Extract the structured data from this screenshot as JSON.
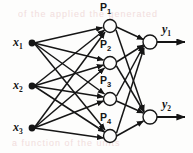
{
  "figure": {
    "background_color": "#fdfdfc",
    "ink_color": "#151515",
    "ghost_text_color": "#f0d8d8",
    "width": 193,
    "height": 153
  },
  "ghost_text": {
    "top": "of the applied the generated",
    "bottom": "a  function  of  the  units"
  },
  "layers": {
    "input": {
      "name": "input-layer",
      "nodes": [
        {
          "id": "x1",
          "label": "x",
          "subscript": "1",
          "cx": 32,
          "cy": 43,
          "label_x": 13,
          "label_y": 35
        },
        {
          "id": "x2",
          "label": "x",
          "subscript": "2",
          "cx": 32,
          "cy": 86,
          "label_x": 13,
          "label_y": 78
        },
        {
          "id": "x3",
          "label": "x",
          "subscript": "3",
          "cx": 32,
          "cy": 128,
          "label_x": 13,
          "label_y": 120
        }
      ]
    },
    "hidden": {
      "name": "hidden-layer",
      "nodes": [
        {
          "id": "P1",
          "label": "P",
          "subscript": "1",
          "cx": 110,
          "cy": 26,
          "r": 6.5,
          "label_x": 100,
          "label_y": 1
        },
        {
          "id": "P2",
          "label": "P",
          "subscript": "2",
          "cx": 110,
          "cy": 63,
          "r": 6.5,
          "label_x": 100,
          "label_y": 38
        },
        {
          "id": "P3",
          "label": "P",
          "subscript": "3",
          "cx": 110,
          "cy": 99,
          "r": 6.5,
          "label_x": 100,
          "label_y": 74
        },
        {
          "id": "P4",
          "label": "P",
          "subscript": "4",
          "cx": 110,
          "cy": 136,
          "r": 6.5,
          "label_x": 100,
          "label_y": 111
        }
      ]
    },
    "output": {
      "name": "output-layer",
      "nodes": [
        {
          "id": "y1",
          "label": "y",
          "subscript": "1",
          "cx": 150,
          "cy": 42,
          "r": 7,
          "label_x": 162,
          "label_y": 22,
          "arrow_to_x": 187
        },
        {
          "id": "y2",
          "label": "y",
          "subscript": "2",
          "cx": 150,
          "cy": 117,
          "r": 7,
          "label_x": 162,
          "label_y": 97,
          "arrow_to_x": 187
        }
      ]
    }
  },
  "connections": {
    "input_to_hidden_fully_connected": true,
    "hidden_to_output_fully_connected": true,
    "input_to_hidden_count": 12,
    "hidden_to_output_count": 8,
    "edges_input_hidden": [
      [
        "x1",
        "P1"
      ],
      [
        "x1",
        "P2"
      ],
      [
        "x1",
        "P3"
      ],
      [
        "x1",
        "P4"
      ],
      [
        "x2",
        "P1"
      ],
      [
        "x2",
        "P2"
      ],
      [
        "x2",
        "P3"
      ],
      [
        "x2",
        "P4"
      ],
      [
        "x3",
        "P1"
      ],
      [
        "x3",
        "P2"
      ],
      [
        "x3",
        "P3"
      ],
      [
        "x3",
        "P4"
      ]
    ],
    "edges_hidden_output": [
      [
        "P1",
        "y1"
      ],
      [
        "P1",
        "y2"
      ],
      [
        "P2",
        "y1"
      ],
      [
        "P2",
        "y2"
      ],
      [
        "P3",
        "y1"
      ],
      [
        "P3",
        "y2"
      ],
      [
        "P4",
        "y1"
      ],
      [
        "P4",
        "y2"
      ]
    ]
  }
}
